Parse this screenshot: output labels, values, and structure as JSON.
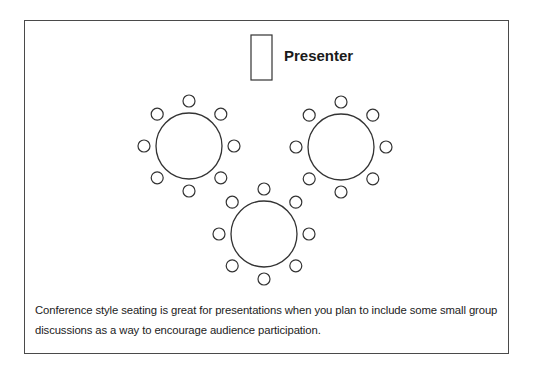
{
  "diagram": {
    "title": "Conference style seating",
    "presenter": {
      "label": "Presenter",
      "podium": {
        "x": 251,
        "y": 35,
        "w": 21,
        "h": 45
      }
    },
    "tables": [
      {
        "name": "table-left",
        "cx": 189,
        "cy": 146,
        "r": 33,
        "chairs": 8
      },
      {
        "name": "table-right",
        "cx": 341,
        "cy": 147,
        "r": 33,
        "chairs": 8
      },
      {
        "name": "table-bottom",
        "cx": 264,
        "cy": 234,
        "r": 33,
        "chairs": 8
      }
    ],
    "chair_radius": 6,
    "chair_distance": 45,
    "stroke_color": "#333333"
  },
  "caption": "Conference style seating is great for presentations when you plan to include some small group discussions as a way to encourage audience participation."
}
